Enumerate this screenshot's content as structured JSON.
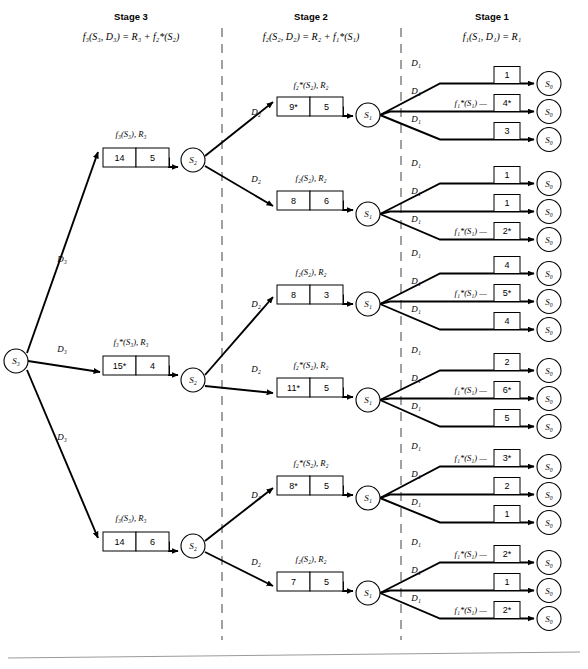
{
  "figure": {
    "kind": "dynamic-programming-decision-tree",
    "stages": [
      {
        "id": "stage3",
        "title": "Stage 3",
        "formula": "f₃(S₃, D₃) = R₃ + f₂*(S₂)",
        "title_x": 131,
        "formula_x": 131
      },
      {
        "id": "stage2",
        "title": "Stage 2",
        "formula": "f₂(S₂, D₂) = R₂ + f₁*(S₁)",
        "title_x": 311,
        "formula_x": 311
      },
      {
        "id": "stage1",
        "title": "Stage 1",
        "formula": "f₁(S₁, D₁) = R₁",
        "title_x": 492,
        "formula_x": 492
      }
    ],
    "dividers": [
      {
        "name": "divider-stage3-stage2",
        "x": 222,
        "y1": 28,
        "y2": 640
      },
      {
        "name": "divider-stage2-stage1",
        "x": 401,
        "y1": 28,
        "y2": 640
      }
    ],
    "footer_rule": {
      "x1": 8,
      "y1": 658,
      "x2": 580,
      "y2": 652
    },
    "root": {
      "label": "S₃",
      "x": 16,
      "y": 361,
      "r": 12
    },
    "stage3_branches": [
      {
        "decision_label": "D₃",
        "decision_x": 62,
        "decision_y": 262,
        "caption": "f₃(S₃), R₃",
        "caption_x": 131,
        "caption_y": 137,
        "box_x": 103,
        "box_y": 148,
        "cells": [
          {
            "value": "14",
            "optimal": false
          },
          {
            "value": "5",
            "optimal": false
          }
        ],
        "node": {
          "label": "S₂",
          "x": 193,
          "y": 160,
          "r": 12
        },
        "edge": {
          "x1": 27,
          "y1": 353,
          "x2": 98,
          "y2": 152
        }
      },
      {
        "decision_label": "D₃",
        "decision_x": 62,
        "decision_y": 352,
        "caption": "f₃*(S₃), R₃",
        "caption_x": 131,
        "caption_y": 345,
        "box_x": 103,
        "box_y": 356,
        "cells": [
          {
            "value": "15*",
            "optimal": true
          },
          {
            "value": "4",
            "optimal": false
          }
        ],
        "node": {
          "label": "S₂",
          "x": 193,
          "y": 380,
          "r": 12
        },
        "edge": {
          "x1": 28,
          "y1": 361,
          "x2": 100,
          "y2": 372
        }
      },
      {
        "decision_label": "D₃",
        "decision_x": 62,
        "decision_y": 440,
        "caption": "f₃(S₃), R₃",
        "caption_x": 131,
        "caption_y": 521,
        "box_x": 103,
        "box_y": 532,
        "cells": [
          {
            "value": "14",
            "optimal": false
          },
          {
            "value": "6",
            "optimal": false
          }
        ],
        "node": {
          "label": "S₂",
          "x": 193,
          "y": 546,
          "r": 12
        },
        "edge": {
          "x1": 27,
          "y1": 370,
          "x2": 98,
          "y2": 538
        }
      }
    ],
    "stage2_branches": [
      {
        "from_node_index": 0,
        "decision_label": "D₂",
        "decision_x": 256,
        "decision_y": 115,
        "caption": "f₂*(S₂), R₂",
        "caption_x": 311,
        "caption_y": 88,
        "box_x": 277,
        "box_y": 97,
        "cells": [
          {
            "value": "9*",
            "optimal": true
          },
          {
            "value": "5",
            "optimal": false
          }
        ],
        "node": {
          "label": "S₁",
          "x": 368,
          "y": 115,
          "r": 12
        },
        "edge": {
          "x1": 205,
          "y1": 156,
          "x2": 273,
          "y2": 102
        },
        "stage1": {
          "decisions": [
            "D₁",
            "D₁",
            "D₁"
          ],
          "rows": [
            {
              "fstar": "",
              "value": "1",
              "optimal": false,
              "y": 75
            },
            {
              "fstar": "f₁*(S₁)",
              "value": "4*",
              "optimal": true,
              "y": 103
            },
            {
              "fstar": "",
              "value": "3",
              "optimal": false,
              "y": 131
            }
          ]
        }
      },
      {
        "from_node_index": 0,
        "decision_label": "D₂",
        "decision_x": 256,
        "decision_y": 182,
        "caption": "f₂(S₂), R₂",
        "caption_x": 311,
        "caption_y": 181,
        "box_x": 277,
        "box_y": 191,
        "cells": [
          {
            "value": "8",
            "optimal": false
          },
          {
            "value": "6",
            "optimal": false
          }
        ],
        "node": {
          "label": "S₁",
          "x": 368,
          "y": 214,
          "r": 12
        },
        "edge": {
          "x1": 205,
          "y1": 166,
          "x2": 273,
          "y2": 206
        },
        "stage1": {
          "decisions": [
            "D₁",
            "D₁",
            "D₁"
          ],
          "rows": [
            {
              "fstar": "",
              "value": "1",
              "optimal": false,
              "y": 175
            },
            {
              "fstar": "",
              "value": "1",
              "optimal": false,
              "y": 203
            },
            {
              "fstar": "f₁*(S₁)",
              "value": "2*",
              "optimal": true,
              "y": 231
            }
          ]
        }
      },
      {
        "from_node_index": 1,
        "decision_label": "D₂",
        "decision_x": 256,
        "decision_y": 307,
        "caption": "f₂(S₂), R₂",
        "caption_x": 311,
        "caption_y": 275,
        "box_x": 277,
        "box_y": 285,
        "cells": [
          {
            "value": "8",
            "optimal": false
          },
          {
            "value": "3",
            "optimal": false
          }
        ],
        "node": {
          "label": "S₁",
          "x": 368,
          "y": 304,
          "r": 12
        },
        "edge": {
          "x1": 205,
          "y1": 375,
          "x2": 273,
          "y2": 297
        },
        "stage1": {
          "decisions": [
            "D₁",
            "D₁",
            "D₁"
          ],
          "rows": [
            {
              "fstar": "",
              "value": "4",
              "optimal": false,
              "y": 265
            },
            {
              "fstar": "f₁*(S₁)",
              "value": "5*",
              "optimal": true,
              "y": 293
            },
            {
              "fstar": "",
              "value": "4",
              "optimal": false,
              "y": 321
            }
          ]
        }
      },
      {
        "from_node_index": 1,
        "decision_label": "D₂",
        "decision_x": 256,
        "decision_y": 372,
        "caption": "f₂*(S₂), R₂",
        "caption_x": 311,
        "caption_y": 368,
        "box_x": 277,
        "box_y": 378,
        "cells": [
          {
            "value": "11*",
            "optimal": true
          },
          {
            "value": "5",
            "optimal": false
          }
        ],
        "node": {
          "label": "S₁",
          "x": 368,
          "y": 400,
          "r": 12
        },
        "edge": {
          "x1": 205,
          "y1": 386,
          "x2": 273,
          "y2": 393
        },
        "stage1": {
          "decisions": [
            "D₁",
            "D₁",
            "D₁"
          ],
          "rows": [
            {
              "fstar": "",
              "value": "2",
              "optimal": false,
              "y": 362
            },
            {
              "fstar": "f₁*(S₁)",
              "value": "6*",
              "optimal": true,
              "y": 390
            },
            {
              "fstar": "",
              "value": "5",
              "optimal": false,
              "y": 418
            }
          ]
        }
      },
      {
        "from_node_index": 2,
        "decision_label": "D₂",
        "decision_x": 256,
        "decision_y": 498,
        "caption": "f₂*(S₂), R₂",
        "caption_x": 311,
        "caption_y": 466,
        "box_x": 277,
        "box_y": 476,
        "cells": [
          {
            "value": "8*",
            "optimal": true
          },
          {
            "value": "5",
            "optimal": false
          }
        ],
        "node": {
          "label": "S₁",
          "x": 368,
          "y": 498,
          "r": 12
        },
        "edge": {
          "x1": 205,
          "y1": 541,
          "x2": 273,
          "y2": 488
        },
        "stage1": {
          "decisions": [
            "D₁",
            "D₁",
            "D₁"
          ],
          "rows": [
            {
              "fstar": "f₁*(S₁)",
              "value": "3*",
              "optimal": true,
              "y": 458
            },
            {
              "fstar": "",
              "value": "2",
              "optimal": false,
              "y": 486
            },
            {
              "fstar": "",
              "value": "1",
              "optimal": false,
              "y": 514
            }
          ]
        }
      },
      {
        "from_node_index": 2,
        "decision_label": "D₂",
        "decision_x": 256,
        "decision_y": 565,
        "caption": "f₂(S₂), R₂",
        "caption_x": 311,
        "caption_y": 562,
        "box_x": 277,
        "box_y": 572,
        "cells": [
          {
            "value": "7",
            "optimal": false
          },
          {
            "value": "5",
            "optimal": false
          }
        ],
        "node": {
          "label": "S₁",
          "x": 368,
          "y": 593,
          "r": 12
        },
        "edge": {
          "x1": 205,
          "y1": 552,
          "x2": 273,
          "y2": 586
        },
        "stage1": {
          "decisions": [
            "D₁",
            "D₁",
            "D₁"
          ],
          "rows": [
            {
              "fstar": "f₁*(S₁)",
              "value": "2*",
              "optimal": true,
              "y": 554
            },
            {
              "fstar": "",
              "value": "1",
              "optimal": false,
              "y": 582
            },
            {
              "fstar": "f₁*(S₁)",
              "value": "2*",
              "optimal": true,
              "y": 610
            }
          ]
        }
      }
    ],
    "terminal": {
      "label": "S₀",
      "x": 549,
      "r": 12,
      "box_x": 494,
      "box_w": 26,
      "box_h": 17,
      "fstar_x": 487
    },
    "geometry": {
      "box_cell_w": 33,
      "box_h": 19,
      "stage3_box_w": 66,
      "stage2_box_w": 66,
      "stage2_box_arrow_end": 356,
      "stage3_box_arrow_end": 181
    }
  }
}
